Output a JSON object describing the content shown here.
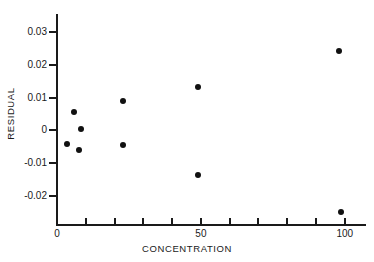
{
  "chart_data": {
    "type": "scatter",
    "title": "",
    "xlabel": "CONCENTRATION",
    "ylabel": "RESIDUAL",
    "xlim": [
      0,
      107
    ],
    "ylim": [
      -0.0285,
      0.0355
    ],
    "grid": false,
    "legend": null,
    "x_ticks": [
      {
        "value": 0,
        "label": "0",
        "major": true
      },
      {
        "value": 10,
        "label": "",
        "major": false
      },
      {
        "value": 20,
        "label": "",
        "major": false
      },
      {
        "value": 30,
        "label": "",
        "major": false
      },
      {
        "value": 40,
        "label": "",
        "major": false
      },
      {
        "value": 50,
        "label": "50",
        "major": true
      },
      {
        "value": 60,
        "label": "",
        "major": false
      },
      {
        "value": 70,
        "label": "",
        "major": false
      },
      {
        "value": 80,
        "label": "",
        "major": false
      },
      {
        "value": 90,
        "label": "",
        "major": false
      },
      {
        "value": 100,
        "label": "100",
        "major": true
      }
    ],
    "y_ticks": [
      {
        "value": 0.03,
        "label": "0.03"
      },
      {
        "value": 0.02,
        "label": "0.02"
      },
      {
        "value": 0.01,
        "label": "0.01"
      },
      {
        "value": 0,
        "label": "0"
      },
      {
        "value": -0.01,
        "label": "-0.01"
      },
      {
        "value": -0.02,
        "label": "-0.02"
      }
    ],
    "points": [
      {
        "x": 6,
        "y": 0.0055
      },
      {
        "x": 3.5,
        "y": -0.0042
      },
      {
        "x": 8.5,
        "y": 0.0004
      },
      {
        "x": 7.5,
        "y": -0.006
      },
      {
        "x": 23,
        "y": 0.0089
      },
      {
        "x": 23,
        "y": -0.0045
      },
      {
        "x": 49,
        "y": 0.0132
      },
      {
        "x": 49,
        "y": -0.0136
      },
      {
        "x": 98,
        "y": 0.0243
      },
      {
        "x": 98.5,
        "y": -0.0248
      }
    ],
    "marker": {
      "shape": "circle",
      "color": "#111111",
      "size": 6
    },
    "axis_color": "#1a1a1a"
  }
}
